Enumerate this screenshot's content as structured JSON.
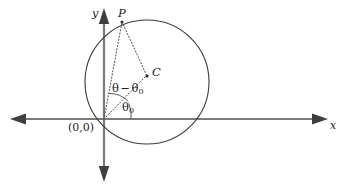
{
  "figure": {
    "type": "geometry-diagram",
    "background_color": "#ffffff",
    "axis_color": "#7a7a7a",
    "curve_color": "#3a3a3a",
    "dotted_color": "#4a4a4a",
    "label_color": "#1a1a1a"
  },
  "axes": {
    "x_label": "x",
    "y_label": "y",
    "origin_label": "(0,0)"
  },
  "points": [
    {
      "id": "P",
      "label": "P",
      "x": 122,
      "y": 22
    },
    {
      "id": "C",
      "label": "C",
      "x": 148,
      "y": 74
    },
    {
      "id": "O",
      "label": "(0,0)",
      "x": 104,
      "y": 119
    }
  ],
  "circle": {
    "center_x": 147,
    "center_y": 82,
    "radius": 62
  },
  "angles": [
    {
      "id": "theta-minus-theta0",
      "symbol": "θ",
      "operator": "−",
      "symbol2": "θ",
      "subscript2": "0",
      "text": "θ − θ0",
      "vertex": "O",
      "between": [
        "OP",
        "OC"
      ]
    },
    {
      "id": "theta0",
      "symbol": "θ",
      "subscript": "0",
      "text": "θ0",
      "vertex": "O",
      "between": [
        "OC",
        "x-axis"
      ]
    }
  ],
  "segments": [
    {
      "id": "OP",
      "from": "O",
      "to": "P",
      "style": "dotted"
    },
    {
      "id": "OC",
      "from": "O",
      "to": "C",
      "style": "dotted"
    },
    {
      "id": "PC",
      "from": "P",
      "to": "C",
      "style": "dotted"
    }
  ]
}
